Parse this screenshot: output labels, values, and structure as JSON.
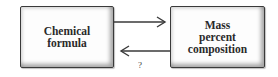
{
  "diagram": {
    "nodes": [
      {
        "id": "chemical-formula",
        "label": "Chemical\nformula"
      },
      {
        "id": "mass-percent-composition",
        "label": "Mass\npercent\ncomposition"
      }
    ],
    "edges": [
      {
        "from": "chemical-formula",
        "to": "mass-percent-composition",
        "label": ""
      },
      {
        "from": "mass-percent-composition",
        "to": "chemical-formula",
        "label": "?"
      }
    ],
    "colors": {
      "stroke": "#3a3a3a",
      "box_fill": "#fdfdfd",
      "text": "#2a2a2a"
    }
  }
}
